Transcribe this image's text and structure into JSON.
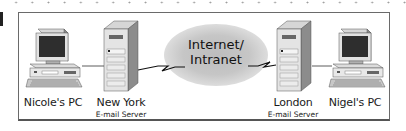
{
  "diagram": {
    "type": "network-email-flow",
    "nodes": [
      {
        "id": "nicole-pc",
        "label": "Nicole's PC",
        "sublabel": "",
        "icon": "desktop-computer-icon"
      },
      {
        "id": "newyork-server",
        "label": "New York",
        "sublabel": "E-mail Server",
        "icon": "tower-server-icon"
      },
      {
        "id": "network",
        "label": "Internet/",
        "label2": "Intranet",
        "icon": "cloud-icon"
      },
      {
        "id": "london-server",
        "label": "London",
        "sublabel": "E-mail Server",
        "icon": "tower-server-icon"
      },
      {
        "id": "nigel-pc",
        "label": "Nigel's PC",
        "sublabel": "",
        "icon": "desktop-computer-icon"
      }
    ],
    "edges": [
      {
        "from": "nicole-pc",
        "to": "newyork-server",
        "style": "line"
      },
      {
        "from": "newyork-server",
        "to": "network",
        "style": "lightning"
      },
      {
        "from": "network",
        "to": "london-server",
        "style": "lightning"
      },
      {
        "from": "london-server",
        "to": "nigel-pc",
        "style": "line"
      }
    ],
    "colors": {
      "frame_border": "#6a6a6a",
      "cloud": "#c4c4c4",
      "device_light": "#e6e6e6",
      "device_mid": "#b5b5b5",
      "device_dark": "#7a7a7a",
      "screen": "#2b2b2b"
    }
  }
}
